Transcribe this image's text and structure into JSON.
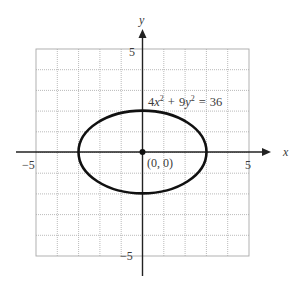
{
  "figure": {
    "equation": {
      "coef_x": "4",
      "var_x": "x",
      "exp_x": "2",
      "plus": "+",
      "coef_y": "9",
      "var_y": "y",
      "exp_y": "2",
      "equals": "=",
      "rhs": "36"
    },
    "center_label": "(0, 0)",
    "axes": {
      "x_label": "x",
      "y_label": "y",
      "x_tick_neg": "−5",
      "x_tick_pos": "5",
      "y_tick_pos": "5",
      "y_tick_neg": "−5"
    },
    "colors": {
      "curve": "#111111",
      "axis": "#222222",
      "grid": "#9a9a9a",
      "text": "#3a3a3a"
    }
  },
  "chart_data": {
    "type": "line",
    "xlabel": "x",
    "ylabel": "y",
    "xlim": [
      -5,
      5
    ],
    "ylim": [
      -5,
      5
    ],
    "grid": true,
    "grid_step": 1,
    "series": [
      {
        "name": "ellipse 4x^2 + 9y^2 = 36",
        "center": [
          0,
          0
        ],
        "semi_major_x": 3,
        "semi_minor_y": 2,
        "key_points": [
          [
            -3,
            0
          ],
          [
            3,
            0
          ],
          [
            0,
            2
          ],
          [
            0,
            -2
          ]
        ]
      }
    ],
    "annotations": [
      {
        "text": "(0, 0)",
        "point": [
          0,
          0
        ]
      },
      {
        "text": "4x^2 + 9y^2 = 36",
        "position": "above ellipse, right of y-axis"
      }
    ],
    "tick_labels": {
      "x": [
        "-5",
        "5"
      ],
      "y": [
        "5",
        "-5"
      ]
    }
  }
}
